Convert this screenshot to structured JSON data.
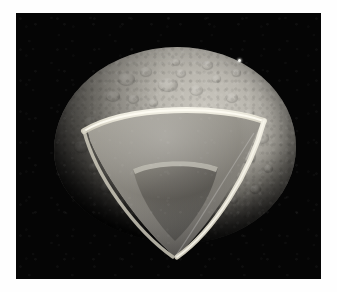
{
  "figure": {
    "title": "Cutaway view of a small icy satellite",
    "caption": "",
    "background_color": "#050505",
    "page_color": "#ffffff"
  },
  "plate": {
    "name": "space-background",
    "color": "#050505",
    "left": 16,
    "top": 13,
    "width": 305,
    "height": 266
  },
  "object": {
    "name": "planetary-body",
    "shape": "irregular oblate ellipsoid",
    "surface_label": "cratered regolith surface",
    "surface_color": "#b0ada5",
    "highlight_color": "#d0cdc5",
    "shadow_color": "#2c2b28",
    "illumination": "upper-right"
  },
  "cutaway": {
    "name": "cutaway-wedge",
    "shape": "rounded triangular octant section",
    "layers": [
      {
        "name": "crust",
        "label": "Crust",
        "color": "#efece1",
        "description": "thin bright outer rim"
      },
      {
        "name": "mantle",
        "label": "Mantle",
        "color": "#918e86",
        "description": "mid-gray interior shell"
      },
      {
        "name": "core",
        "label": "Core",
        "color": "#5a5853",
        "description": "darker rounded triangular inner core"
      }
    ]
  },
  "markers": {
    "bright_speck": {
      "name": "bright-speck",
      "color": "#f2f2ee",
      "x": 238,
      "y": 59
    }
  }
}
